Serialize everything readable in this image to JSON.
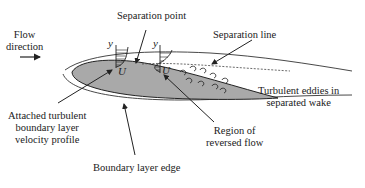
{
  "diagram": {
    "labels": {
      "flow_direction_line1": "Flow",
      "flow_direction_line2": "direction",
      "separation_point": "Separation point",
      "separation_line": "Separation line",
      "turbulent_eddies_line1": "Turbulent eddies in",
      "turbulent_eddies_line2": "separated wake",
      "attached_profile_line1": "Attached turbulent",
      "attached_profile_line2": "boundary layer",
      "attached_profile_line3": "velocity profile",
      "reversed_flow_line1": "Region of",
      "reversed_flow_line2": "reversed flow",
      "boundary_layer_edge": "Boundary layer edge"
    },
    "symbols": {
      "y_axis_1": "y",
      "u_axis_1": "U",
      "y_axis_2": "y",
      "u_axis_2": "U"
    },
    "colors": {
      "airfoil_fill": "#a9a9a9",
      "outline": "#222222",
      "text": "#1a1a1a",
      "background": "#ffffff"
    }
  }
}
